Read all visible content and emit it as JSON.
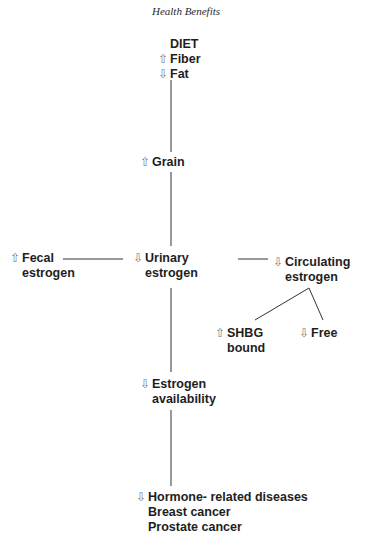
{
  "header": {
    "title": "Health Benefits"
  },
  "icons": {
    "up": "⇧",
    "down": "⇩"
  },
  "nodes": {
    "diet": {
      "title": "DIET",
      "items": [
        {
          "dir": "up",
          "label": "Fiber"
        },
        {
          "dir": "down",
          "label": "Fat"
        }
      ]
    },
    "grain": {
      "dir": "up",
      "label": "Grain"
    },
    "fecal": {
      "dir": "up",
      "lines": [
        "Fecal",
        "estrogen"
      ]
    },
    "urinary": {
      "dir": "down",
      "lines": [
        "Urinary",
        "estrogen"
      ]
    },
    "circulating": {
      "dir": "down",
      "lines": [
        "Circulating",
        "estrogen"
      ]
    },
    "shbg": {
      "dir": "up",
      "lines": [
        "SHBG",
        "bound"
      ]
    },
    "free": {
      "dir": "down",
      "label": "Free"
    },
    "availability": {
      "dir": "down",
      "lines": [
        "Estrogen",
        "availability"
      ]
    },
    "diseases": {
      "dir": "down",
      "lines": [
        "Hormone- related diseases",
        "Breast cancer",
        "Prostate cancer"
      ]
    }
  }
}
